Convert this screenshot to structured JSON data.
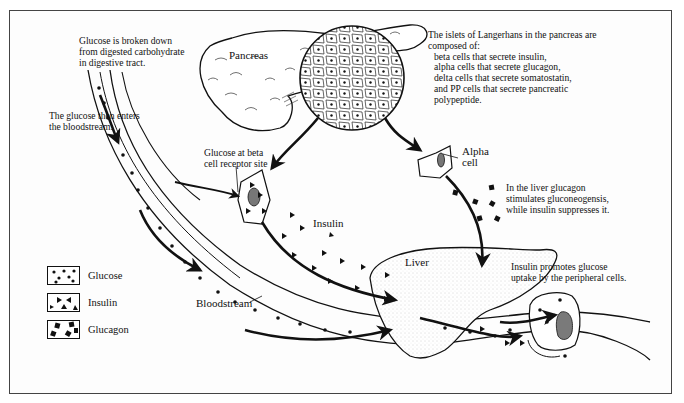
{
  "diagram": {
    "organs": {
      "pancreas": "Pancreas",
      "liver": "Liver",
      "bloodstream": "Bloodstream",
      "alpha_cell": "Alpha cell",
      "alpha_cell_line1": "Alpha",
      "alpha_cell_line2": "cell",
      "insulin_label": "Insulin"
    },
    "annotations": {
      "digestion": [
        "Glucose is broken down",
        "from digested carbohydrate",
        "in digestive tract."
      ],
      "bloodstream_entry": [
        "The glucose then enters",
        "the bloodstream."
      ],
      "beta_receptor": [
        "Glucose at beta",
        "cell receptor site"
      ],
      "islets": {
        "intro": [
          "The islets of Langerhans in the pancreas are",
          "composed of:"
        ],
        "items": [
          "beta cells that secrete insulin,",
          "alpha cells that secrete glucagon,",
          "delta cells that secrete somatostatin,",
          "and PP cells that secrete pancreatic",
          "polypeptide."
        ]
      },
      "liver_glucagon": [
        "In the liver glucagon",
        "stimulates gluconeogensis,",
        "while insulin suppresses it."
      ],
      "peripheral_uptake": [
        "Insulin promotes glucose",
        "uptake by the peripheral cells."
      ]
    },
    "legend": [
      {
        "label": "Glucose",
        "symbol": "dot"
      },
      {
        "label": "Insulin",
        "symbol": "triangle"
      },
      {
        "label": "Glucagon",
        "symbol": "square"
      }
    ],
    "colors": {
      "ink": "#111111",
      "frame": "#444444",
      "background": "#fdfdfd",
      "nucleus": "#777777"
    }
  }
}
